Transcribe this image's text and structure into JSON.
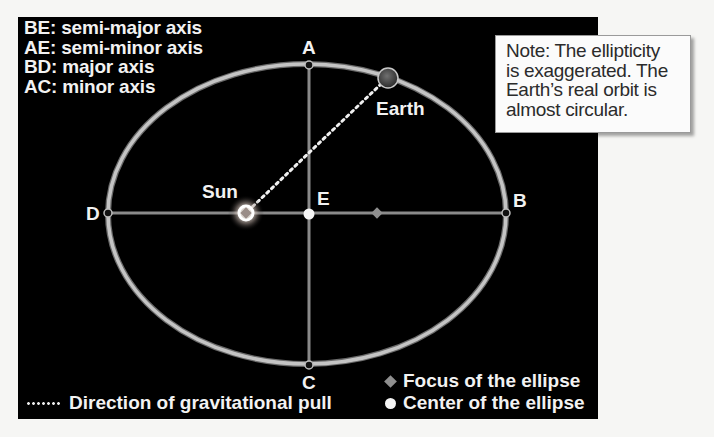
{
  "key": {
    "lines": [
      "BE: semi-major axis",
      "AE: semi-minor axis",
      "BD: major axis",
      "AC: minor axis"
    ]
  },
  "note": {
    "lines": [
      "Note: The ellipticity",
      "is exaggerated. The",
      "Earth’s real orbit is",
      "almost circular."
    ]
  },
  "points": {
    "A": "A",
    "B": "B",
    "C": "C",
    "D": "D",
    "E": "E"
  },
  "bodies": {
    "sun": "Sun",
    "earth": "Earth"
  },
  "legend": {
    "gravity": "Direction of gravitational pull",
    "focus": "Focus of the ellipse",
    "center": "Center of the ellipse"
  },
  "colors": {
    "background": "#000000",
    "orbit": "#b9b9b9",
    "axes": "#8a8a8a",
    "focus": "#8f8f8f",
    "text": "#f2f2f2",
    "note_bg": "#fbfbfb"
  }
}
